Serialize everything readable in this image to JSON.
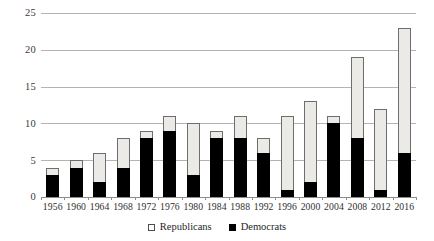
{
  "chart_data": {
    "type": "bar",
    "subtype": "stacked-vertical",
    "title": "",
    "subtitle": "",
    "xlabel": "",
    "ylabel": "",
    "categories": [
      "1956",
      "1960",
      "1964",
      "1968",
      "1972",
      "1976",
      "1980",
      "1984",
      "1988",
      "1992",
      "1996",
      "2000",
      "2004",
      "2008",
      "2012",
      "2016"
    ],
    "series": [
      {
        "name": "Republicans",
        "color": "#eceae7",
        "values": [
          1,
          1,
          4,
          4,
          1,
          2,
          7,
          1,
          3,
          2,
          10,
          11,
          1,
          11,
          11,
          17
        ]
      },
      {
        "name": "Democrats",
        "color": "#000000",
        "values": [
          3,
          4,
          2,
          4,
          8,
          9,
          3,
          8,
          8,
          6,
          1,
          2,
          10,
          8,
          1,
          6
        ]
      }
    ],
    "totals": [
      4,
      5,
      6,
      8,
      9,
      11,
      10,
      9,
      11,
      8,
      11,
      13,
      11,
      19,
      12,
      23
    ],
    "ylim": [
      0,
      25
    ],
    "yticks": [
      0,
      5,
      10,
      15,
      20,
      25
    ],
    "ytick_labels": [
      "0",
      "5",
      "10",
      "15",
      "20",
      "25"
    ],
    "grid": true,
    "grid_axis": "y",
    "legend_position": "bottom-center",
    "legend_entries": [
      {
        "label": "Republicans",
        "swatch": "open-square"
      },
      {
        "label": "Democrats",
        "swatch": "filled-square"
      }
    ]
  }
}
